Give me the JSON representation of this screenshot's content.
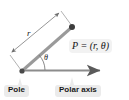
{
  "figure": {
    "background_color": "#ffffff",
    "width": 129,
    "height": 100
  },
  "labels": {
    "point": "P = (r, θ)",
    "radius": "r",
    "angle": "θ",
    "pole": "Pole",
    "polar_axis": "Polar axis"
  },
  "colors": {
    "ray": "#8c8c8c",
    "axis": "#8c8c8c",
    "dimension_line": "#7a7a7a",
    "point_dot": "#3d3d3d",
    "callout_bg": "#ebebeb",
    "text": "#1a1a1a"
  },
  "geometry": {
    "pole_point": [
      22,
      72
    ],
    "point_p": [
      72,
      27
    ],
    "axis_end": [
      103,
      70
    ],
    "angle_degrees": 42
  }
}
